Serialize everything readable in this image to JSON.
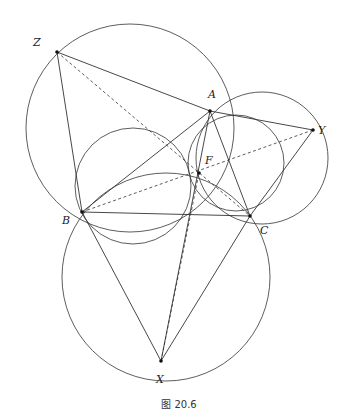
{
  "figure": {
    "caption": "图 20.6",
    "colors": {
      "stroke": "#333333",
      "point": "#111111",
      "background": "#ffffff"
    },
    "points": {
      "Z": {
        "x": 57,
        "y": 52,
        "label": "Z",
        "lx": 33,
        "ly": 46
      },
      "A": {
        "x": 210,
        "y": 111,
        "label": "A",
        "lx": 208,
        "ly": 98
      },
      "Y": {
        "x": 313,
        "y": 130,
        "label": "Y",
        "lx": 318,
        "ly": 134
      },
      "F": {
        "x": 199,
        "y": 173,
        "label": "F",
        "lx": 205,
        "ly": 164
      },
      "B": {
        "x": 82,
        "y": 212,
        "label": "B",
        "lx": 62,
        "ly": 224
      },
      "C": {
        "x": 250,
        "y": 216,
        "label": "C",
        "lx": 260,
        "ly": 234
      },
      "X": {
        "x": 161,
        "y": 361,
        "label": "X",
        "lx": 156,
        "ly": 383
      }
    },
    "circles": [
      {
        "name": "circle-ABZ",
        "cx": 130,
        "cy": 128,
        "r": 104
      },
      {
        "name": "circle-ACY",
        "cx": 262,
        "cy": 158,
        "r": 66
      },
      {
        "name": "circle-BCX",
        "cx": 166,
        "cy": 277,
        "r": 104
      },
      {
        "name": "circle-AFB",
        "cx": 133,
        "cy": 186,
        "r": 58
      },
      {
        "name": "circle-AFC",
        "cx": 236,
        "cy": 163,
        "r": 48
      }
    ],
    "solid_segments": [
      [
        "Z",
        "A"
      ],
      [
        "A",
        "Y"
      ],
      [
        "Z",
        "B"
      ],
      [
        "B",
        "C"
      ],
      [
        "A",
        "B"
      ],
      [
        "A",
        "C"
      ],
      [
        "Y",
        "C"
      ],
      [
        "B",
        "X"
      ],
      [
        "C",
        "X"
      ],
      [
        "A",
        "X"
      ]
    ],
    "dashed_segments": [
      [
        "Z",
        "C"
      ],
      [
        "B",
        "Y"
      ],
      [
        "X",
        "F"
      ]
    ]
  }
}
